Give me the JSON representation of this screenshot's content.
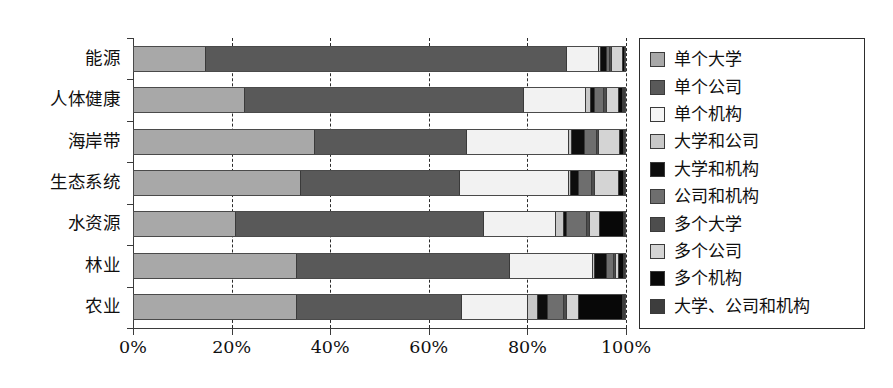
{
  "chart_data": {
    "type": "bar",
    "orientation": "horizontal",
    "stacked": true,
    "normalized_percent": true,
    "title": "",
    "xlabel": "",
    "ylabel": "",
    "xlim": [
      0,
      100
    ],
    "grid": true,
    "grid_axis": "x",
    "grid_style": "dashed",
    "legend_position": "right",
    "xtick_labels": [
      "0%",
      "20%",
      "40%",
      "60%",
      "80%",
      "100%"
    ],
    "xtick_values": [
      0,
      20,
      40,
      60,
      80,
      100
    ],
    "categories": [
      "能源",
      "人体健康",
      "海岸带",
      "生态系统",
      "水资源",
      "林业",
      "农业"
    ],
    "series": [
      {
        "name": "单个大学",
        "color": "#a8a8a8",
        "values": [
          14.4,
          22.4,
          36.6,
          33.8,
          20.6,
          33.2,
          33.0
        ]
      },
      {
        "name": "单个公司",
        "color": "#595959",
        "values": [
          73.6,
          56.8,
          31.0,
          32.4,
          50.4,
          43.6,
          33.6
        ]
      },
      {
        "name": "单个机构",
        "color": "#f2f2f2",
        "values": [
          6.6,
          12.6,
          20.8,
          22.2,
          14.8,
          17.0,
          13.4
        ]
      },
      {
        "name": "大学和公司",
        "color": "#c8c8c8",
        "values": [
          0.4,
          1.0,
          0.6,
          0.5,
          1.6,
          0.4,
          2.0
        ]
      },
      {
        "name": "大学和机构",
        "color": "#0d0d0d",
        "values": [
          1.2,
          0.8,
          2.6,
          1.6,
          0.6,
          2.6,
          2.2
        ]
      },
      {
        "name": "公司和机构",
        "color": "#6e6e6e",
        "values": [
          0.5,
          2.0,
          2.4,
          2.6,
          4.0,
          1.4,
          3.2
        ]
      },
      {
        "name": "多个大学",
        "color": "#4d4d4d",
        "values": [
          0.4,
          0.5,
          0.5,
          0.5,
          0.6,
          0.4,
          0.5
        ]
      },
      {
        "name": "多个公司",
        "color": "#d4d4d4",
        "values": [
          2.3,
          2.4,
          4.2,
          5.0,
          2.2,
          0.5,
          2.6
        ]
      },
      {
        "name": "多个机构",
        "color": "#080808",
        "values": [
          0.4,
          1.0,
          1.0,
          1.0,
          4.8,
          1.2,
          9.0
        ]
      },
      {
        "name": "大学、公司和机构",
        "color": "#3d3d3d",
        "values": [
          0.2,
          0.5,
          0.3,
          0.4,
          0.4,
          0.3,
          0.5
        ]
      }
    ]
  },
  "legend": {
    "items": [
      {
        "label": "单个大学",
        "color": "#a8a8a8"
      },
      {
        "label": "单个公司",
        "color": "#595959"
      },
      {
        "label": "单个机构",
        "color": "#f5f5f5"
      },
      {
        "label": "大学和公司",
        "color": "#c8c8c8"
      },
      {
        "label": "大学和机构",
        "color": "#0d0d0d"
      },
      {
        "label": "公司和机构",
        "color": "#6e6e6e"
      },
      {
        "label": "多个大学",
        "color": "#4d4d4d"
      },
      {
        "label": "多个公司",
        "color": "#d4d4d4"
      },
      {
        "label": "多个机构",
        "color": "#080808"
      },
      {
        "label": "大学、公司和机构",
        "color": "#3d3d3d"
      }
    ]
  }
}
